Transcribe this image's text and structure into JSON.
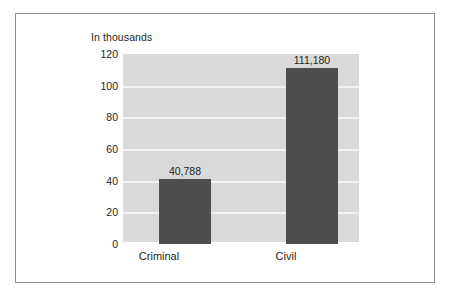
{
  "chart_data": {
    "type": "bar",
    "title": "",
    "subtitle": "In thousands",
    "xlabel": "",
    "ylabel": "",
    "categories": [
      "Criminal",
      "Civil"
    ],
    "values": [
      40.788,
      111.18
    ],
    "value_labels": [
      "40,788",
      "111,180"
    ],
    "ylim": [
      0,
      120
    ],
    "yticks": [
      0,
      20,
      40,
      60,
      80,
      100,
      120
    ],
    "ytick_labels": [
      "0",
      "20",
      "40",
      "60",
      "80",
      "100",
      "120"
    ],
    "grid": "horizontal",
    "legend": "none",
    "units": "thousands",
    "colors": {
      "bar": "#4d4d4d",
      "plot_background": "#d9d9d9",
      "gridline": "#f2f2f2",
      "frame_border": "#8e8e8e",
      "text": "#231f20",
      "page_background": "#ffffff"
    }
  }
}
